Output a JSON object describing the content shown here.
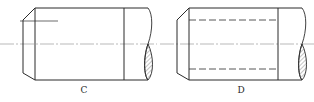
{
  "figure": {
    "type": "engineering drawing - shaft end views (thread representation)",
    "views": [
      {
        "id": "C",
        "label": "C",
        "description": "Shaft end with chamfer, short thread-root line, thread-end line, break with hatched section",
        "features": [
          "chamfer",
          "thread-root-line-short",
          "thread-end-line",
          "centerline",
          "break-line",
          "section-hatch"
        ]
      },
      {
        "id": "D",
        "label": "D",
        "description": "Shaft end with chamfer, hidden (dashed) thread-root lines, thread-end line, break with hatched section",
        "features": [
          "chamfer",
          "thread-root-lines-dashed",
          "thread-end-line",
          "centerline",
          "break-line",
          "section-hatch"
        ]
      }
    ],
    "colors": {
      "line": "#2b2b2b",
      "centerline": "#8a8a8a",
      "hatch": "#555555",
      "background": "#ffffff"
    }
  }
}
